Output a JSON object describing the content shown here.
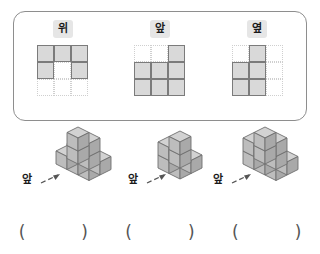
{
  "page": {
    "top_partial_text": "",
    "language": "ko"
  },
  "views_panel": {
    "views": [
      {
        "label": "위",
        "name": "top-view",
        "grid": [
          [
            1,
            1,
            1
          ],
          [
            1,
            0,
            1
          ],
          [
            0,
            0,
            0
          ]
        ]
      },
      {
        "label": "앞",
        "name": "front-view",
        "grid": [
          [
            0,
            0,
            1
          ],
          [
            1,
            1,
            1
          ],
          [
            1,
            1,
            1
          ]
        ]
      },
      {
        "label": "옆",
        "name": "side-view",
        "grid": [
          [
            0,
            1,
            0
          ],
          [
            1,
            1,
            0
          ],
          [
            1,
            1,
            0
          ]
        ]
      }
    ]
  },
  "figures": [
    {
      "front_label": "앞",
      "name": "cube-figure-1"
    },
    {
      "front_label": "앞",
      "name": "cube-figure-2"
    },
    {
      "front_label": "앞",
      "name": "cube-figure-3"
    }
  ],
  "answers": [
    {
      "open": "(",
      "close": ")"
    },
    {
      "open": "(",
      "close": ")"
    },
    {
      "open": "(",
      "close": ")"
    }
  ],
  "colors": {
    "cell_fill": "#d9d9d9",
    "cell_stroke": "#7b7b7b",
    "grid_dotted": "#cfcfcf",
    "panel_border": "#8e8e8e",
    "label_bg": "#e6e6e6",
    "cube_top": "#d2d2d2",
    "cube_left": "#bdbdbd",
    "cube_right": "#a9a9a9",
    "cube_edge": "#6f6f6f"
  }
}
